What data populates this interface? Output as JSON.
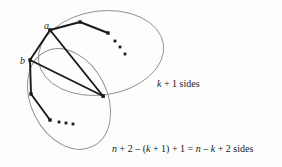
{
  "figure": {
    "type": "graph-theory-diagram",
    "background_color": "#fdfdfd",
    "stroke_color": "#1a1a1a",
    "ellipse_stroke_color": "#8a8a8a",
    "vertices": {
      "a": {
        "label": "a",
        "x": 50,
        "y": 30
      },
      "b": {
        "label": "b",
        "x": 30,
        "y": 60
      }
    },
    "regions": {
      "upper": {
        "label_parts": {
          "var": "k",
          "text_after": " + 1 sides"
        },
        "label_full": "k + 1 sides",
        "ellipse": {
          "cx": 101,
          "cy": 53,
          "rx": 63,
          "ry": 42,
          "rotation": -8
        }
      },
      "lower": {
        "label_parts": {
          "v1": "n",
          "t1": " + 2 – (",
          "v2": "k",
          "t2": " + 1) + 1 = ",
          "v3": "n",
          "t3": " – ",
          "v4": "k",
          "t4": " + 2 sides"
        },
        "label_full": "n + 2 – (k + 1) + 1 = n – k + 2 sides",
        "ellipse": {
          "cx": 69,
          "cy": 99,
          "rx": 38,
          "ry": 53,
          "rotation": -27
        }
      }
    },
    "upper_chain": {
      "points": [
        [
          50,
          30
        ],
        [
          80,
          22
        ],
        [
          108,
          33
        ]
      ],
      "dots": [
        [
          115,
          41
        ],
        [
          120,
          47
        ],
        [
          125,
          54
        ]
      ]
    },
    "lower_chain": {
      "points": [
        [
          30,
          60
        ],
        [
          31,
          94
        ],
        [
          50,
          120
        ]
      ],
      "dots": [
        [
          59,
          122
        ],
        [
          66,
          123
        ],
        [
          73,
          124
        ]
      ]
    },
    "edges": [
      {
        "from": "a",
        "to": "b",
        "points": [
          [
            50,
            30
          ],
          [
            30,
            60
          ]
        ]
      },
      {
        "from": "a",
        "to": "convergence",
        "points": [
          [
            50,
            30
          ],
          [
            103,
            96
          ]
        ]
      },
      {
        "from": "b",
        "to": "convergence",
        "points": [
          [
            30,
            60
          ],
          [
            103,
            96
          ]
        ]
      }
    ],
    "convergence_vertex": {
      "x": 103,
      "y": 96
    }
  }
}
